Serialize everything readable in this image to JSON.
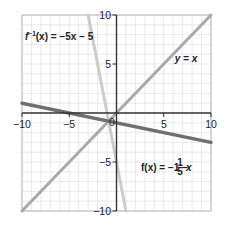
{
  "chart_data": {
    "type": "line",
    "title": "",
    "xlabel": "",
    "ylabel": "",
    "xlim": [
      -10,
      10
    ],
    "ylim": [
      -10,
      10
    ],
    "grid": true,
    "grid_step": 1,
    "x_ticks": [
      -10,
      -5,
      0,
      5,
      10
    ],
    "y_ticks": [
      -10,
      -5,
      5,
      10
    ],
    "x_tick_labels": [
      "−10",
      "−5",
      "0",
      "5",
      "10"
    ],
    "y_tick_labels": [
      "−10",
      "−5",
      "5",
      "10"
    ],
    "series": [
      {
        "name": "y = x",
        "label": "y = x",
        "color": "#a9a9a9",
        "x": [
          -10,
          10
        ],
        "y": [
          -10,
          10
        ]
      },
      {
        "name": "f(x) = −1 − (1/5)x",
        "label": "f(x) = −1 − ⅕x",
        "color": "#6f6f6f",
        "x": [
          -10,
          10
        ],
        "y": [
          1,
          -3
        ]
      },
      {
        "name": "f⁻¹(x) = −5x − 5",
        "label": "f⁻¹(x) = −5x − 5",
        "color": "#cccccc",
        "x": [
          -3,
          1
        ],
        "y": [
          10,
          -10
        ]
      }
    ],
    "annotations": [
      {
        "text": "f⁻¹(x) = −5x − 5",
        "x": -9.5,
        "y": 7.5
      },
      {
        "text": "y = x",
        "x": 7,
        "y": 4.8
      },
      {
        "text": "f(x) = −1 − ⅕x",
        "x": 2.5,
        "y": -5.4
      }
    ]
  },
  "labels": {
    "inverse_eq_main": "f",
    "inverse_eq_sup": "−1",
    "inverse_eq_rest": "(x) = −5x − 5",
    "identity_eq": "y = x",
    "f_eq_main": "f(x) = −1 − ",
    "f_eq_num": "1",
    "f_eq_den": "5",
    "f_eq_var": "x"
  },
  "ticks": {
    "x_m10": "−10",
    "x_m5": "−5",
    "x_0": "0",
    "x_5": "5",
    "x_10": "10",
    "y_10": "10",
    "y_5": "5",
    "y_m5": "−5",
    "y_m10": "−10"
  }
}
